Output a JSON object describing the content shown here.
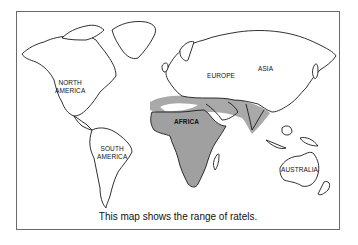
{
  "map": {
    "title": "World map",
    "caption": "This map shows the range of ratels.",
    "labels": {
      "north_america_line1": "NORTH",
      "north_america_line2": "AMERICA",
      "south_america_line1": "SOUTH",
      "south_america_line2": "AMERICA",
      "europe": "EUROPE",
      "asia": "ASIA",
      "africa": "AFRICA",
      "australia": "AUSTRALIA"
    },
    "highlighted_region": "ratel range (Africa, Arabian Peninsula, western/southern Asia to India)",
    "colors": {
      "range_fill": "#a9a9a9",
      "land_fill": "#ffffff",
      "outline": "#1a1a1a",
      "frame": "#6a6a6a"
    }
  }
}
